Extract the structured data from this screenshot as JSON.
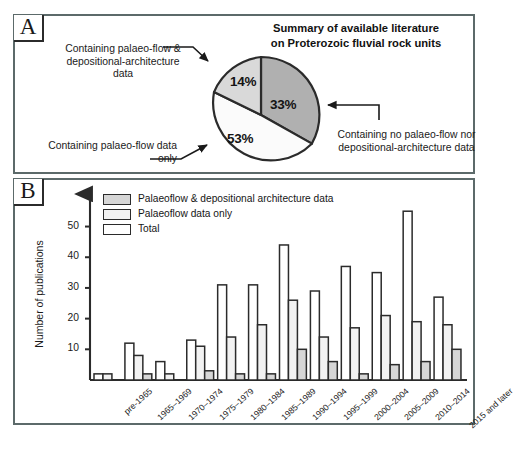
{
  "figure": {
    "panel_a": {
      "tag": "A"
    },
    "panel_b": {
      "tag": "B"
    }
  },
  "pie_panel": {
    "title": "Summary of available literature on Proterozoic fluvial rock units",
    "title_line1": "Summary of available literature",
    "title_line2": "on Proterozoic fluvial rock units",
    "annotations": {
      "top_left": "Containing palaeo-flow & depositional-architecture data",
      "bottom_left": "Containing palaeo-flow data only",
      "right": "Containing no palaeo-flow nor depositional-architecture data"
    },
    "colors": {
      "slice_no_data": "#b0b0b0",
      "slice_both": "#d9d9d9",
      "slice_palaeoflow_only": "#fbfbfb",
      "outline": "#2b2b2b"
    }
  },
  "chart_data": [
    {
      "type": "pie",
      "title": "Summary of available literature on Proterozoic fluvial rock units",
      "labels": [
        "Containing no palaeo-flow nor depositional-architecture data",
        "Containing palaeo-flow & depositional-architecture data",
        "Containing palaeo-flow data only"
      ],
      "short_labels": [
        "No palaeoflow nor architecture",
        "Palaeoflow & architecture",
        "Palaeoflow only"
      ],
      "values": [
        33,
        14,
        53
      ],
      "value_labels": [
        "33%",
        "14%",
        "53%"
      ],
      "colors": [
        "#b0b0b0",
        "#d9d9d9",
        "#fbfbfb"
      ],
      "legend": "annotated",
      "grid": false
    },
    {
      "type": "bar",
      "title": "",
      "xlabel": "",
      "ylabel": "Number of publications",
      "ylim": [
        0,
        58
      ],
      "yticks": [
        10,
        20,
        30,
        40,
        50
      ],
      "ytick_labels": [
        "10",
        "20",
        "30",
        "40",
        "50"
      ],
      "grid": false,
      "legend_position": "top-left",
      "categories": [
        "pre-1965",
        "1965–1969",
        "1970–1974",
        "1975–1979",
        "1980–1984",
        "1985–1989",
        "1990–1994",
        "1995–1999",
        "2000–2004",
        "2005–2009",
        "2010–2014",
        "2015 and later"
      ],
      "series": [
        {
          "name": "Total",
          "fill": "#ffffff",
          "values": [
            2,
            12,
            6,
            13,
            31,
            31,
            44,
            29,
            37,
            35,
            55,
            27
          ]
        },
        {
          "name": "Palaeoflow data only",
          "fill": "#f2f2f2",
          "values": [
            2,
            8,
            2,
            11,
            14,
            18,
            26,
            14,
            17,
            21,
            19,
            18
          ]
        },
        {
          "name": "Palaeoflow & depositional architecture data",
          "fill": "#d6d6d6",
          "values": [
            0,
            2,
            0,
            3,
            2,
            2,
            10,
            6,
            2,
            5,
            6,
            10
          ]
        }
      ],
      "legend_entries": [
        "Palaeoflow & depositional architecture data",
        "Palaeoflow data only",
        "Total"
      ]
    }
  ]
}
